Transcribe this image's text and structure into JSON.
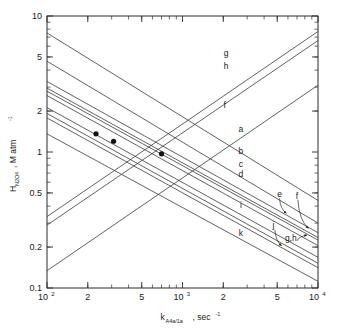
{
  "chart_data": {
    "type": "line",
    "title": "",
    "xlabel": "k_A4a/1a , sec^-1",
    "xlabel_parts": {
      "base": "k",
      "sub": "A4a/1a",
      "rest": ", sec",
      "sup": "-1"
    },
    "ylabel": "H_N2O4 , M atm^-1",
    "ylabel_parts": {
      "base": "H",
      "sub": "N2O4",
      "rest": ", M  atm",
      "sup": "-1"
    },
    "xscale": "log",
    "yscale": "log",
    "xlim": [
      100,
      10000
    ],
    "ylim": [
      0.1,
      10
    ],
    "grid": false,
    "legend_position": "inline-right-labels",
    "x_tick_labels": [
      {
        "value": 100,
        "text": "10",
        "sup": "2"
      },
      {
        "value": 200,
        "text": "2",
        "sup": ""
      },
      {
        "value": 500,
        "text": "5",
        "sup": ""
      },
      {
        "value": 1000,
        "text": "10",
        "sup": "3"
      },
      {
        "value": 2000,
        "text": "2",
        "sup": ""
      },
      {
        "value": 5000,
        "text": "5",
        "sup": ""
      },
      {
        "value": 10000,
        "text": "10",
        "sup": "4"
      }
    ],
    "y_tick_labels": [
      {
        "value": 10,
        "text": "10"
      },
      {
        "value": 5,
        "text": "5"
      },
      {
        "value": 2,
        "text": "2"
      },
      {
        "value": 1,
        "text": "1"
      },
      {
        "value": 0.5,
        "text": "0.5"
      },
      {
        "value": 0.2,
        "text": "0.2"
      },
      {
        "value": 0.1,
        "text": "0.1"
      }
    ],
    "x_minor_ticks": [
      200,
      300,
      400,
      500,
      600,
      700,
      800,
      900,
      2000,
      3000,
      4000,
      5000,
      6000,
      7000,
      8000,
      9000
    ],
    "y_minor_ticks": [
      0.2,
      0.3,
      0.4,
      0.5,
      0.6,
      0.7,
      0.8,
      0.9,
      2,
      3,
      4,
      5,
      6,
      7,
      8,
      9
    ],
    "series": [
      {
        "name": "g",
        "label": "g",
        "label_at": {
          "x": 2100,
          "y": 5.1
        },
        "points": [
          {
            "x": 100,
            "y": 0.335
          },
          {
            "x": 10000,
            "y": 7.7
          }
        ]
      },
      {
        "name": "h",
        "label": "h",
        "label_at": {
          "x": 2100,
          "y": 4.1
        },
        "points": [
          {
            "x": 100,
            "y": 0.29
          },
          {
            "x": 10000,
            "y": 6.6
          }
        ]
      },
      {
        "name": "f",
        "label": "f",
        "label_at": {
          "x": 2050,
          "y": 2.12
        },
        "points": [
          {
            "x": 100,
            "y": 0.134
          },
          {
            "x": 10000,
            "y": 3.1
          }
        ]
      },
      {
        "name": "a",
        "label": "a",
        "label_at": {
          "x": 2700,
          "y": 1.4
        },
        "points": [
          {
            "x": 100,
            "y": 7.5
          },
          {
            "x": 10000,
            "y": 0.44
          }
        ]
      },
      {
        "name": "b",
        "label": "b",
        "label_at": {
          "x": 2700,
          "y": 0.96
        },
        "points": [
          {
            "x": 100,
            "y": 4.65
          },
          {
            "x": 10000,
            "y": 0.3
          }
        ]
      },
      {
        "name": "c",
        "label": "c",
        "label_at": {
          "x": 2700,
          "y": 0.78
        },
        "points": [
          {
            "x": 100,
            "y": 3.3
          },
          {
            "x": 10000,
            "y": 0.255
          }
        ]
      },
      {
        "name": "d",
        "label": "d",
        "label_at": {
          "x": 2700,
          "y": 0.655
        },
        "points": [
          {
            "x": 100,
            "y": 2.95
          },
          {
            "x": 10000,
            "y": 0.235
          }
        ]
      },
      {
        "name": "e",
        "label": "e",
        "label_at": {
          "x": 5200,
          "y": 0.465
        },
        "points": [
          {
            "x": 100,
            "y": 2.8
          },
          {
            "x": 10000,
            "y": 0.225
          }
        ]
      },
      {
        "name": "f2",
        "label": "f",
        "label_at": {
          "x": 7000,
          "y": 0.455
        },
        "points": [
          {
            "x": 100,
            "y": 2.6
          },
          {
            "x": 10000,
            "y": 0.205
          }
        ]
      },
      {
        "name": "i",
        "label": "i",
        "label_at": {
          "x": 2700,
          "y": 0.385
        },
        "points": [
          {
            "x": 100,
            "y": 2.12
          },
          {
            "x": 10000,
            "y": 0.168
          }
        ]
      },
      {
        "name": "j",
        "label": "j",
        "label_at": {
          "x": 4700,
          "y": 0.275
        },
        "points": [
          {
            "x": 100,
            "y": 1.92
          },
          {
            "x": 10000,
            "y": 0.152
          }
        ]
      },
      {
        "name": "gh",
        "label": "g,h",
        "label_at": {
          "x": 6300,
          "y": 0.222
        },
        "points": [
          {
            "x": 100,
            "y": 1.78
          },
          {
            "x": 10000,
            "y": 0.141
          }
        ]
      },
      {
        "name": "k",
        "label": "k",
        "label_at": {
          "x": 2700,
          "y": 0.243
        },
        "points": [
          {
            "x": 100,
            "y": 1.36
          },
          {
            "x": 10000,
            "y": 0.112
          }
        ]
      }
    ],
    "markers": [
      {
        "x": 230,
        "y": 1.36,
        "style": "filled-circle"
      },
      {
        "x": 310,
        "y": 1.2,
        "style": "filled-circle"
      },
      {
        "x": 700,
        "y": 0.97,
        "style": "filled-circle"
      }
    ],
    "annotations": [
      {
        "label": "e",
        "arrow_from": {
          "x": 5200,
          "y": 0.455
        },
        "arrow_to": {
          "x": 5850,
          "y": 0.355
        }
      },
      {
        "label": "f",
        "arrow_from": {
          "x": 7100,
          "y": 0.445
        },
        "arrow_to": {
          "x": 8500,
          "y": 0.275
        }
      },
      {
        "label": "j",
        "arrow_from": {
          "x": 4800,
          "y": 0.268
        },
        "arrow_to": {
          "x": 5400,
          "y": 0.205
        }
      },
      {
        "label": "g,h",
        "arrow_from": {
          "x": 7000,
          "y": 0.222
        },
        "arrow_to": {
          "x": 8300,
          "y": 0.245
        }
      }
    ]
  }
}
